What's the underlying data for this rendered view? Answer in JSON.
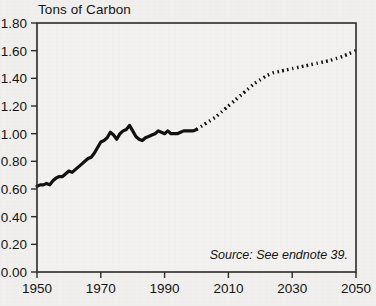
{
  "chart_data": {
    "type": "line",
    "title": "Tons of Carbon",
    "xlabel": "",
    "ylabel": "Tons of Carbon",
    "xlim": [
      1950,
      2050
    ],
    "ylim": [
      0.0,
      1.8
    ],
    "grid": false,
    "legend": "none",
    "x_ticks": [
      "1950",
      "1970",
      "1990",
      "2010",
      "2030",
      "2050"
    ],
    "x_tick_values": [
      1950,
      1970,
      1990,
      2010,
      2030,
      2050
    ],
    "y_ticks": [
      "0.00",
      "0.20",
      "0.40",
      "0.60",
      "0.80",
      "1.00",
      "1.20",
      "1.40",
      "1.60",
      "1.80"
    ],
    "y_tick_values": [
      0.0,
      0.2,
      0.4,
      0.6,
      0.8,
      1.0,
      1.2,
      1.4,
      1.6,
      1.8
    ],
    "annotations": [
      {
        "name": "source-note",
        "text": "Source: See endnote 39."
      }
    ],
    "series": [
      {
        "name": "historical",
        "style": "solid",
        "color": "#111111",
        "x": [
          1950,
          1951,
          1952,
          1953,
          1954,
          1955,
          1956,
          1957,
          1958,
          1959,
          1960,
          1961,
          1962,
          1963,
          1964,
          1965,
          1966,
          1967,
          1968,
          1969,
          1970,
          1971,
          1972,
          1973,
          1974,
          1975,
          1976,
          1977,
          1978,
          1979,
          1980,
          1981,
          1982,
          1983,
          1984,
          1985,
          1986,
          1987,
          1988,
          1989,
          1990,
          1991,
          1992,
          1993,
          1994,
          1995,
          1996,
          1997,
          1998,
          1999,
          2000
        ],
        "y": [
          0.62,
          0.63,
          0.63,
          0.64,
          0.63,
          0.66,
          0.68,
          0.69,
          0.69,
          0.71,
          0.73,
          0.72,
          0.74,
          0.76,
          0.78,
          0.8,
          0.82,
          0.83,
          0.86,
          0.9,
          0.94,
          0.95,
          0.97,
          1.01,
          0.99,
          0.96,
          1.0,
          1.02,
          1.03,
          1.06,
          1.02,
          0.98,
          0.96,
          0.95,
          0.97,
          0.98,
          0.99,
          1.0,
          1.02,
          1.01,
          1.0,
          1.02,
          1.0,
          1.0,
          1.0,
          1.01,
          1.02,
          1.02,
          1.02,
          1.02,
          1.03
        ]
      },
      {
        "name": "projection",
        "style": "dotted",
        "color": "#111111",
        "x": [
          2000,
          2002,
          2004,
          2006,
          2008,
          2010,
          2012,
          2014,
          2016,
          2018,
          2020,
          2022,
          2024,
          2026,
          2028,
          2030,
          2032,
          2034,
          2036,
          2038,
          2040,
          2042,
          2044,
          2046,
          2048,
          2050
        ],
        "y": [
          1.03,
          1.06,
          1.09,
          1.12,
          1.16,
          1.2,
          1.24,
          1.28,
          1.32,
          1.36,
          1.39,
          1.42,
          1.44,
          1.45,
          1.46,
          1.47,
          1.48,
          1.49,
          1.5,
          1.51,
          1.52,
          1.53,
          1.545,
          1.56,
          1.58,
          1.6
        ]
      }
    ]
  },
  "layout": {
    "plot_left": 37,
    "plot_right": 356,
    "plot_top": 23,
    "plot_bottom": 272
  }
}
